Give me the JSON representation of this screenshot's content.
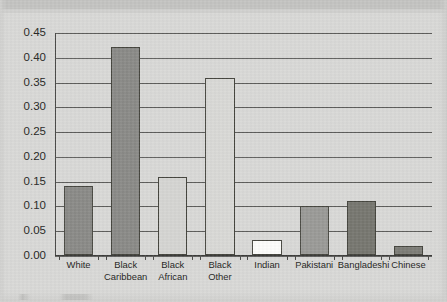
{
  "chart_data": {
    "type": "bar",
    "title": "",
    "subtitle": "",
    "xlabel": "",
    "ylabel": "",
    "categories": [
      "White",
      "Black Caribbean",
      "Black African",
      "Black Other",
      "Indian",
      "Pakistani",
      "Bangladeshi",
      "Chinese"
    ],
    "category_lines": [
      [
        "White"
      ],
      [
        "Black",
        "Caribbean"
      ],
      [
        "Black",
        "African"
      ],
      [
        "Black",
        "Other"
      ],
      [
        "Indian"
      ],
      [
        "Pakistani"
      ],
      [
        "Bangladeshi"
      ],
      [
        "Chinese"
      ]
    ],
    "values": [
      0.14,
      0.42,
      0.158,
      0.358,
      0.03,
      0.098,
      0.108,
      0.018
    ],
    "bar_fills": [
      "#8a8a87",
      "#8a8a87",
      "#d5d5d2",
      "#d9d9d6",
      "#fdfdfb",
      "#9a9a97",
      "#76766f",
      "#7c7c76"
    ],
    "ylim": [
      0.0,
      0.45
    ],
    "ytick_values": [
      0.45,
      0.4,
      0.35,
      0.3,
      0.25,
      0.2,
      0.15,
      0.1,
      0.05,
      0.0
    ],
    "ytick_labels": [
      "0.45",
      "0.40",
      "0.35",
      "0.30",
      "0.25",
      "0.20",
      "0.15",
      "0.10",
      "0.05",
      "0.00"
    ],
    "grid": true,
    "legend": null,
    "legend_position": "none",
    "annotations": []
  },
  "page": {
    "background_color": "#d9d9d7",
    "axis_color": "#4a4a48",
    "grid_color": "#5d5d5b",
    "bar_border_color": "#46463f",
    "text_color": "#1f1f1d"
  }
}
